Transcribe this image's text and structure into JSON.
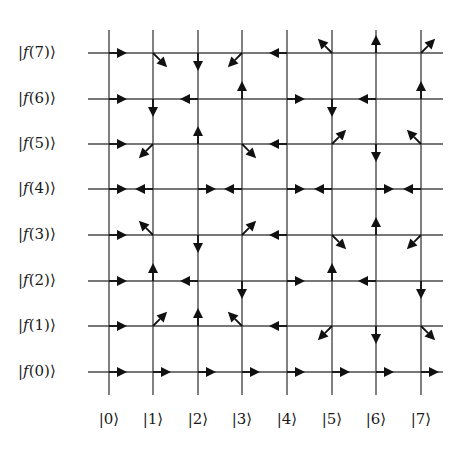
{
  "grid": {
    "columns": 8,
    "rows": 8,
    "x_positions": [
      109,
      153,
      198,
      242,
      287,
      332,
      376,
      421
    ],
    "y_positions": [
      372,
      326,
      281,
      235,
      189,
      144,
      99,
      53
    ],
    "line_color": "#4a4a4a",
    "arrow_color": "#111111"
  },
  "row_labels": [
    {
      "prefix": "|",
      "func": "f",
      "arg": "(0)",
      "suffix": "⟩"
    },
    {
      "prefix": "|",
      "func": "f",
      "arg": "(1)",
      "suffix": "⟩"
    },
    {
      "prefix": "|",
      "func": "f",
      "arg": "(2)",
      "suffix": "⟩"
    },
    {
      "prefix": "|",
      "func": "f",
      "arg": "(3)",
      "suffix": "⟩"
    },
    {
      "prefix": "|",
      "func": "f",
      "arg": "(4)",
      "suffix": "⟩"
    },
    {
      "prefix": "|",
      "func": "f",
      "arg": "(5)",
      "suffix": "⟩"
    },
    {
      "prefix": "|",
      "func": "f",
      "arg": "(6)",
      "suffix": "⟩"
    },
    {
      "prefix": "|",
      "func": "f",
      "arg": "(7)",
      "suffix": "⟩"
    }
  ],
  "column_labels": [
    "|0⟩",
    "|1⟩",
    "|2⟩",
    "|3⟩",
    "|4⟩",
    "|5⟩",
    "|6⟩",
    "|7⟩"
  ],
  "arrows": [
    [
      "E",
      "E",
      "E",
      "E",
      "E",
      "E",
      "E",
      "E"
    ],
    [
      "E",
      "NE",
      "N",
      "NW",
      "W",
      "SW",
      "S",
      "SE"
    ],
    [
      "E",
      "N",
      "W",
      "S",
      "E",
      "N",
      "W",
      "S"
    ],
    [
      "E",
      "NW",
      "S",
      "NE",
      "W",
      "SE",
      "N",
      "SW"
    ],
    [
      "E",
      "W",
      "E",
      "W",
      "E",
      "W",
      "E",
      "W"
    ],
    [
      "E",
      "SW",
      "N",
      "SE",
      "W",
      "NE",
      "S",
      "NW"
    ],
    [
      "E",
      "S",
      "W",
      "N",
      "E",
      "S",
      "W",
      "N"
    ],
    [
      "E",
      "SE",
      "S",
      "SW",
      "W",
      "NW",
      "N",
      "NE"
    ]
  ]
}
